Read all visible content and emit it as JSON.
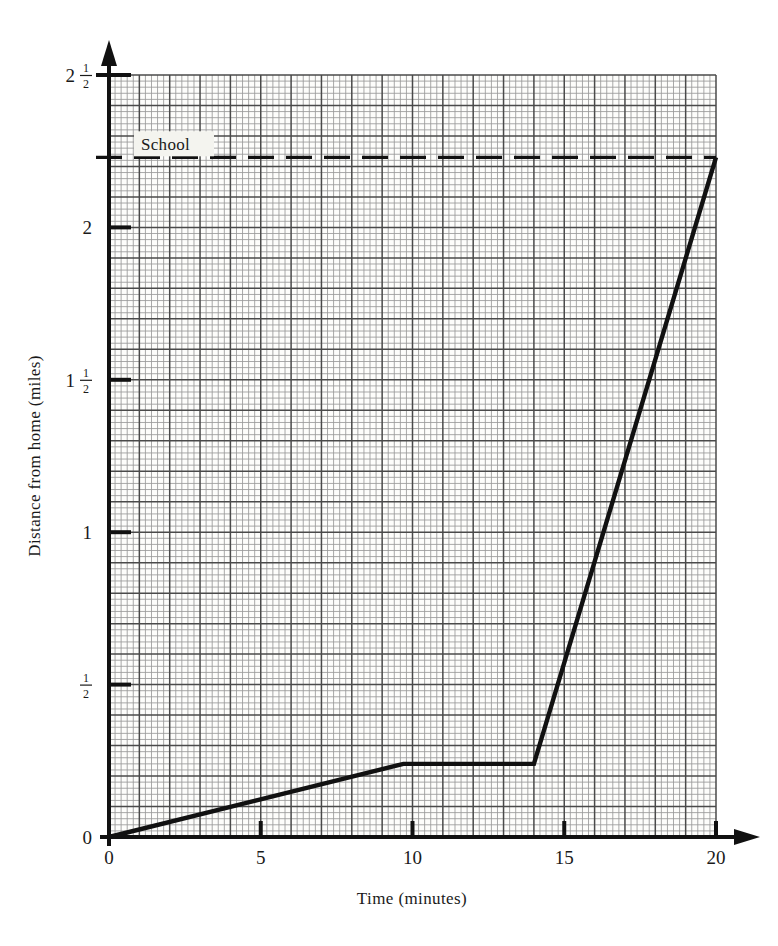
{
  "chart_data": {
    "type": "line",
    "title": "",
    "subtitle": "",
    "xlabel": "Time (minutes)",
    "ylabel": "Distance from home (miles)",
    "xlim": [
      0,
      20
    ],
    "ylim": [
      0,
      2.5
    ],
    "grid": true,
    "grid_style": "fine graph paper, minor cells of 0.1 min x 0.0125 miles, heavier lines every 5 cells",
    "legend": "none",
    "x_ticks": [
      {
        "value": 0,
        "label": "0"
      },
      {
        "value": 5,
        "label": "5"
      },
      {
        "value": 10,
        "label": "10"
      },
      {
        "value": 15,
        "label": "15"
      },
      {
        "value": 20,
        "label": "20"
      }
    ],
    "y_ticks": [
      {
        "value": 0,
        "label": "0",
        "whole": "0",
        "numerator": "",
        "denominator": ""
      },
      {
        "value": 0.5,
        "label": "1/2",
        "whole": "",
        "numerator": "1",
        "denominator": "2"
      },
      {
        "value": 1,
        "label": "1",
        "whole": "1",
        "numerator": "",
        "denominator": ""
      },
      {
        "value": 1.5,
        "label": "1 1/2",
        "whole": "1",
        "numerator": "1",
        "denominator": "2"
      },
      {
        "value": 2,
        "label": "2",
        "whole": "2",
        "numerator": "",
        "denominator": ""
      },
      {
        "value": 2.5,
        "label": "2 1/2",
        "whole": "2",
        "numerator": "1",
        "denominator": "2"
      }
    ],
    "series": [
      {
        "name": "journey",
        "x": [
          0,
          9.7,
          14,
          20
        ],
        "values": [
          0,
          0.24,
          0.24,
          2.23
        ],
        "color": "#111111"
      }
    ],
    "annotations": [
      {
        "name": "school-line",
        "label": "School",
        "type": "horizontal-dashed-line",
        "y": 2.23,
        "color": "#111111"
      }
    ]
  },
  "axes": {
    "x_title": "Time (minutes)",
    "y_title": "Distance from home (miles)",
    "arrow_x": "arrow-right",
    "arrow_y": "arrow-up"
  },
  "colors": {
    "ink": "#111111",
    "grid_minor": "#9a9a9a",
    "grid_major": "#4a4a4a",
    "paper": "#fdfdfb",
    "label_box": "#f4f4ef"
  }
}
